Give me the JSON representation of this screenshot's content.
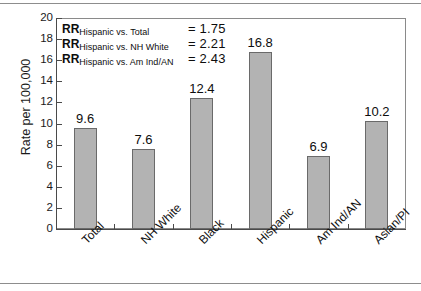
{
  "chart_data": {
    "type": "bar",
    "title": "",
    "xlabel": "",
    "ylabel": "Rate per 100,000",
    "ylim": [
      0,
      20
    ],
    "ytick_step": 2,
    "yticks": [
      20,
      18,
      16,
      14,
      12,
      10,
      8,
      6,
      4,
      2,
      0
    ],
    "grid": false,
    "legend": "none",
    "categories": [
      "Total",
      "NH White",
      "Black",
      "Hispanic",
      "Am Ind/AN",
      "Asian/PI"
    ],
    "values": [
      9.6,
      7.6,
      12.4,
      16.8,
      6.9,
      10.2
    ],
    "value_labels": [
      "9.6",
      "7.6",
      "12.4",
      "16.8",
      "6.9",
      "10.2"
    ],
    "bar_color": "#b3b3b3",
    "bar_border_color": "#6a6a6a",
    "annotations": [
      {
        "prefix": "RR",
        "subscript": "Hispanic vs. Total",
        "value": "= 1.75"
      },
      {
        "prefix": "RR",
        "subscript": "Hispanic vs. NH White",
        "value": "= 2.21"
      },
      {
        "prefix": "RR",
        "subscript": "Hispanic vs. Am Ind/AN",
        "value": "= 2.43"
      }
    ]
  }
}
